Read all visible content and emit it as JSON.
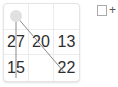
{
  "board": {
    "rows": 3,
    "cols": 3,
    "cells": [
      [
        "",
        "",
        ""
      ],
      [
        "27",
        "20",
        "13"
      ],
      [
        "15",
        "",
        "22"
      ]
    ],
    "start_marker": {
      "row": 0,
      "col": 0,
      "color": "#e0e0e0"
    },
    "path_color": "#8a8a8a",
    "paths": [
      {
        "from": [
          0,
          0
        ],
        "to": [
          2,
          0
        ]
      },
      {
        "from": [
          0,
          0
        ],
        "to": [
          2,
          2
        ]
      }
    ]
  },
  "controls": {
    "add_checkbox_checked": false,
    "add_label": "+"
  }
}
